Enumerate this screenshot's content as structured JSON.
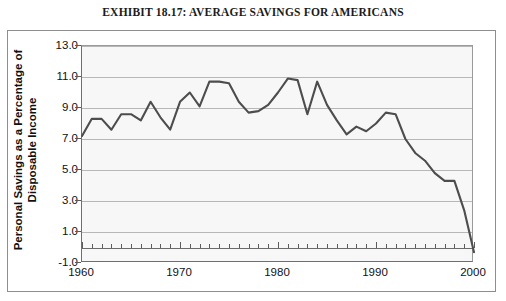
{
  "title": "EXHIBIT 18.17: AVERAGE SAVINGS FOR AMERICANS",
  "axes": {
    "ylabel_line1": "Personal Savings as a Percentage of",
    "ylabel_line2": "Disposable Income",
    "yticks": [
      "13.0",
      "11.0",
      "9.0",
      "7.0",
      "5.0",
      "3.0",
      "1.0",
      "-1.0"
    ],
    "xticks": [
      "1960",
      "1970",
      "1980",
      "1990",
      "2000"
    ]
  },
  "style": {
    "line_color": "#4d4d4d",
    "plot_background": "#f7f7f7",
    "grid_color": "#b7b7b7",
    "axis_color": "#6f6f6f",
    "text_color": "#111111"
  },
  "chart_data": {
    "type": "line",
    "title": "EXHIBIT 18.17: AVERAGE SAVINGS FOR AMERICANS",
    "xlabel": "",
    "ylabel": "Personal Savings as a Percentage of Disposable Income",
    "xlim": [
      1960,
      2000
    ],
    "ylim": [
      -1.0,
      13.0
    ],
    "ytick_step": 2.0,
    "xtick_step": 10,
    "minor_xtick_step": 1,
    "grid": true,
    "legend": false,
    "series": [
      {
        "name": "Personal savings rate",
        "x": [
          1960,
          1961,
          1962,
          1963,
          1964,
          1965,
          1966,
          1967,
          1968,
          1969,
          1970,
          1971,
          1972,
          1973,
          1974,
          1975,
          1976,
          1977,
          1978,
          1979,
          1980,
          1981,
          1982,
          1983,
          1984,
          1985,
          1986,
          1987,
          1988,
          1989,
          1990,
          1991,
          1992,
          1993,
          1994,
          1995,
          1996,
          1997,
          1998,
          1999,
          2000
        ],
        "values": [
          7.2,
          8.3,
          8.3,
          7.6,
          8.6,
          8.6,
          8.2,
          9.4,
          8.4,
          7.6,
          9.4,
          10.0,
          9.1,
          10.7,
          10.7,
          10.6,
          9.4,
          8.7,
          8.8,
          9.2,
          10.0,
          10.9,
          10.8,
          8.6,
          10.7,
          9.2,
          8.2,
          7.3,
          7.8,
          7.5,
          8.0,
          8.7,
          8.6,
          7.0,
          6.1,
          5.6,
          4.8,
          4.3,
          4.3,
          2.4,
          -0.3
        ]
      }
    ]
  }
}
